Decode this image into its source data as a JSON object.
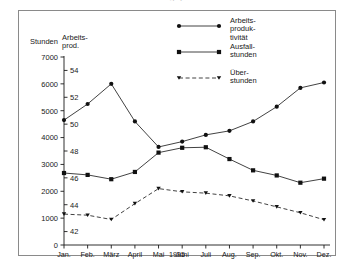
{
  "figure": {
    "clipped_caption": "g y",
    "left_axis_title": "Stunden",
    "right_axis_title_line1": "Arbeits-",
    "right_axis_title_line2": "prod.",
    "year": "1995"
  },
  "legend": {
    "position": "inside-top-right",
    "items": [
      {
        "label_line1": "Arbeits-",
        "label_line2": "produk-",
        "label_line3": "tivität",
        "marker": "circle",
        "line": "solid"
      },
      {
        "label_line1": "Ausfall-",
        "label_line2": "stunden",
        "label_line3": "",
        "marker": "square",
        "line": "solid"
      },
      {
        "label_line1": "Über-",
        "label_line2": "stunden",
        "label_line3": "",
        "marker": "triangle-down",
        "line": "dashed"
      }
    ]
  },
  "chart_data": {
    "type": "line",
    "title": "",
    "xlabel": "1995",
    "categories": [
      "Jan.",
      "Feb.",
      "März",
      "April",
      "Mai",
      "Juni",
      "Juli",
      "Aug.",
      "Sep.",
      "Okt.",
      "Nov.",
      "Dez."
    ],
    "grid": false,
    "axes": {
      "left": {
        "label": "Stunden",
        "ticks": [
          0,
          1000,
          2000,
          3000,
          4000,
          5000,
          6000,
          7000
        ],
        "ylim": [
          0,
          7000
        ]
      },
      "right": {
        "label": "Arbeits- prod.",
        "ticks": [
          42,
          44,
          46,
          48,
          50,
          52,
          54
        ],
        "ylim": [
          41,
          55
        ]
      }
    },
    "series": [
      {
        "name": "Arbeitsproduktivität",
        "axis": "right",
        "marker": "circle",
        "line": "solid",
        "values": [
          50.3,
          51.5,
          53.0,
          50.2,
          48.3,
          48.7,
          49.2,
          49.5,
          50.2,
          51.3,
          52.7,
          53.1
        ]
      },
      {
        "name": "Ausfallstunden",
        "axis": "left",
        "marker": "square",
        "line": "solid",
        "values": [
          2680,
          2610,
          2450,
          2720,
          3440,
          3620,
          3640,
          3200,
          2780,
          2590,
          2320,
          2470
        ]
      },
      {
        "name": "Überstunden",
        "axis": "left",
        "marker": "triangle-down",
        "line": "dashed",
        "values": [
          1150,
          1110,
          950,
          1540,
          2100,
          1980,
          1930,
          1830,
          1640,
          1420,
          1200,
          940
        ]
      }
    ]
  }
}
